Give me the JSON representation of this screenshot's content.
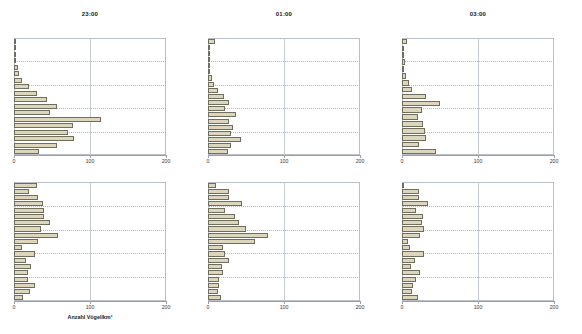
{
  "figure": {
    "xlabel": "Anzahl Vögel/km²",
    "tick_labels": [
      "0",
      "100",
      "200"
    ],
    "bar_fill": "#ddd6bd",
    "bar_stroke": "#6f6d5c",
    "grid_color": "#b0b6be"
  },
  "chart_data": [
    {
      "id": "panel-1",
      "type": "bar",
      "orientation": "horizontal",
      "title": "23:00",
      "xlabel": "",
      "ylabel": "",
      "xlim": [
        0,
        200
      ],
      "xticks": [
        0,
        100,
        200
      ],
      "grid": true,
      "values": [
        3,
        1,
        2,
        3,
        5,
        7,
        11,
        20,
        30,
        43,
        57,
        48,
        115,
        78,
        71,
        79,
        56,
        33
      ]
    },
    {
      "id": "panel-2",
      "type": "bar",
      "orientation": "horizontal",
      "title": "01:00",
      "xlabel": "",
      "ylabel": "",
      "xlim": [
        0,
        200
      ],
      "xticks": [
        0,
        100,
        200
      ],
      "grid": true,
      "values": [
        9,
        0,
        0,
        2,
        2,
        3,
        5,
        8,
        13,
        21,
        28,
        23,
        37,
        27,
        33,
        30,
        44,
        30,
        26
      ]
    },
    {
      "id": "panel-3",
      "type": "bar",
      "orientation": "horizontal",
      "title": "03:00",
      "xlabel": "",
      "ylabel": "",
      "xlim": [
        0,
        200
      ],
      "xticks": [
        0,
        100,
        200
      ],
      "grid": true,
      "values": [
        7,
        0,
        0,
        4,
        3,
        5,
        9,
        13,
        31,
        50,
        26,
        21,
        28,
        30,
        32,
        23,
        45
      ],
      "note": "last bar extends to ~45"
    },
    {
      "id": "panel-4",
      "type": "bar",
      "orientation": "horizontal",
      "title": "",
      "xlabel": "Anzahl Vögel/km²",
      "ylabel": "",
      "xlim": [
        0,
        200
      ],
      "xticks": [
        0,
        100,
        200
      ],
      "grid": true,
      "values": [
        30,
        20,
        31,
        38,
        40,
        39,
        47,
        36,
        58,
        31,
        11,
        27,
        16,
        22,
        19,
        18,
        27,
        21,
        12
      ]
    },
    {
      "id": "panel-5",
      "type": "bar",
      "orientation": "horizontal",
      "title": "",
      "xlabel": "",
      "ylabel": "",
      "xlim": [
        0,
        200
      ],
      "xticks": [
        0,
        100,
        200
      ],
      "grid": true,
      "values": [
        11,
        27,
        27,
        45,
        22,
        35,
        41,
        50,
        79,
        62,
        20,
        22,
        28,
        19,
        20,
        15,
        14,
        13,
        17
      ]
    },
    {
      "id": "panel-6",
      "type": "bar",
      "orientation": "horizontal",
      "title": "",
      "xlabel": "",
      "ylabel": "",
      "xlim": [
        0,
        200
      ],
      "xticks": [
        0,
        100,
        200
      ],
      "grid": true,
      "values": [
        2,
        22,
        22,
        34,
        19,
        27,
        26,
        29,
        24,
        8,
        11,
        29,
        17,
        12,
        24,
        18,
        14,
        13,
        21
      ]
    }
  ]
}
